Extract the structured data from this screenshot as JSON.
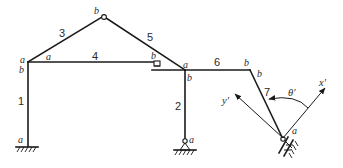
{
  "figure": {
    "type": "plane frame structural diagram",
    "colors": {
      "line": "#1a1a1a",
      "background": "#ffffff"
    }
  },
  "members": [
    {
      "id": "1",
      "label": "1",
      "start_label": "a",
      "end_label": "b",
      "description": "left column"
    },
    {
      "id": "2",
      "label": "2",
      "start_label": "a",
      "end_label": "b",
      "description": "right column on pin support"
    },
    {
      "id": "3",
      "label": "3",
      "start_label": "a",
      "end_label": "b",
      "description": "left rafter"
    },
    {
      "id": "4",
      "label": "4",
      "start_label": "a",
      "end_label": "b",
      "description": "horizontal tie"
    },
    {
      "id": "5",
      "label": "5",
      "start_label": "b",
      "end_label": "a",
      "description": "right rafter"
    },
    {
      "id": "6",
      "label": "6",
      "start_label": "a",
      "end_label": "b",
      "description": "horizontal beam"
    },
    {
      "id": "7",
      "label": "7",
      "start_label": "b",
      "end_label": "a",
      "description": "inclined member on inclined roller"
    }
  ],
  "end_labels": {
    "m1_bottom": "a",
    "m1_top": "b",
    "m3_left": "a",
    "m4_left": "a",
    "m3_top": "b",
    "m5_top": "b",
    "m4_right": "b",
    "m5_right": "a",
    "m6_left": "a",
    "m2_top": "b",
    "m2_bottom": "a",
    "m6_right": "b",
    "m7_top": "b",
    "m7_bottom": "a"
  },
  "axes": {
    "x_prime": "x′",
    "y_prime": "y′",
    "angle": "θ′"
  },
  "supports": [
    {
      "name": "fixed-support",
      "at": "member 1 end a"
    },
    {
      "name": "pin-support",
      "at": "member 2 end a"
    },
    {
      "name": "inclined-roller-support",
      "at": "member 7 end a"
    }
  ]
}
